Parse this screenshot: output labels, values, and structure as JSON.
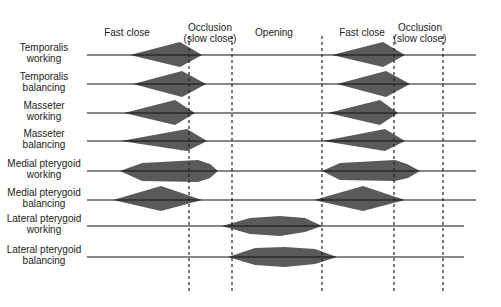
{
  "diagram": {
    "type": "muscle-activity-timeline",
    "phases": [
      {
        "label_line1": "Fast close",
        "label_line2": "",
        "x": 127
      },
      {
        "label_line1": "Occlusion",
        "label_line2": "(slow close)",
        "x": 210
      },
      {
        "label_line1": "Opening",
        "label_line2": "",
        "x": 274
      },
      {
        "label_line1": "Fast close",
        "label_line2": "",
        "x": 362
      },
      {
        "label_line1": "Occlusion",
        "label_line2": "(slow close)",
        "x": 420
      }
    ],
    "dividers_x": [
      189,
      232,
      322,
      394,
      443
    ],
    "rows": [
      {
        "line1": "Temporalis",
        "line2": "working",
        "y": 55
      },
      {
        "line1": "Temporalis",
        "line2": "balancing",
        "y": 84
      },
      {
        "line1": "Masseter",
        "line2": "working",
        "y": 113
      },
      {
        "line1": "Masseter",
        "line2": "balancing",
        "y": 141
      },
      {
        "line1": "Medial pterygoid",
        "line2": "working",
        "y": 171
      },
      {
        "line1": "Medial pterygoid",
        "line2": "balancing",
        "y": 200
      },
      {
        "line1": "Lateral pterygoid",
        "line2": "working",
        "y": 226
      },
      {
        "line1": "Lateral pterygoid",
        "line2": "balancing",
        "y": 257
      }
    ],
    "colors": {
      "burst_fill": "#5a5a5a",
      "line": "#111111",
      "divider": "#222222"
    }
  }
}
